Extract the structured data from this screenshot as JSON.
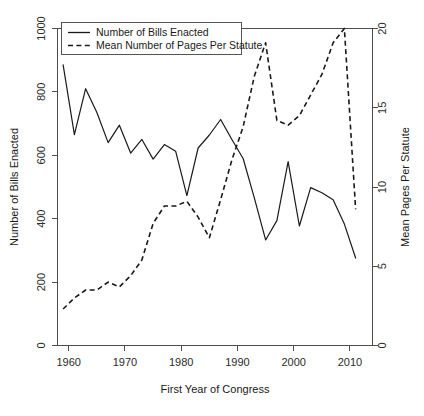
{
  "chart_data": {
    "type": "line",
    "title": "",
    "xlabel": "First Year of Congress",
    "ylabel": "Number of Bills Enacted",
    "y2label": "Mean Pages Per Statute",
    "xlim": [
      1958,
      2014
    ],
    "ylim": [
      0,
      1000
    ],
    "y2lim": [
      0,
      20
    ],
    "grid": false,
    "legend_position": "top-left",
    "x_ticks": [
      1960,
      1970,
      1980,
      1990,
      2000,
      2010
    ],
    "y_ticks": [
      0,
      200,
      400,
      600,
      800,
      1000
    ],
    "y2_ticks": [
      0,
      5,
      10,
      15,
      20
    ],
    "x": [
      1959,
      1961,
      1963,
      1965,
      1967,
      1969,
      1971,
      1973,
      1975,
      1977,
      1979,
      1981,
      1983,
      1985,
      1987,
      1989,
      1991,
      1993,
      1995,
      1997,
      1999,
      2001,
      2003,
      2005,
      2007,
      2009,
      2011
    ],
    "series": [
      {
        "name": "Number of Bills Enacted",
        "axis": "left",
        "style": "solid",
        "values": [
          885,
          665,
          810,
          735,
          640,
          695,
          607,
          650,
          588,
          634,
          613,
          473,
          623,
          664,
          713,
          650,
          590,
          465,
          333,
          394,
          580,
          377,
          498,
          482,
          460,
          383,
          276
        ]
      },
      {
        "name": "Mean Number of Pages Per Statute",
        "axis": "right",
        "style": "dashed",
        "values": [
          2.3,
          3.0,
          3.5,
          3.5,
          4.0,
          3.7,
          4.4,
          5.4,
          7.7,
          8.8,
          8.8,
          9.1,
          8.1,
          6.8,
          9.2,
          11.7,
          13.8,
          17.0,
          19.1,
          14.2,
          13.9,
          14.5,
          15.8,
          17.1,
          19.1,
          20.0,
          8.6
        ]
      }
    ]
  },
  "legend": {
    "entries": [
      {
        "label": "Number of Bills Enacted",
        "style": "solid"
      },
      {
        "label": "Mean Number of Pages Per Statute",
        "style": "dashed"
      }
    ]
  },
  "axes": {
    "left": {
      "title": "Number of Bills Enacted",
      "labels": [
        "0",
        "200",
        "400",
        "600",
        "800",
        "1000"
      ]
    },
    "right": {
      "title": "Mean Pages Per Statute",
      "labels": [
        "0",
        "5",
        "10",
        "15",
        "20"
      ]
    },
    "bottom": {
      "title": "First Year of Congress",
      "labels": [
        "1960",
        "1970",
        "1980",
        "1990",
        "2000",
        "2010"
      ]
    }
  }
}
